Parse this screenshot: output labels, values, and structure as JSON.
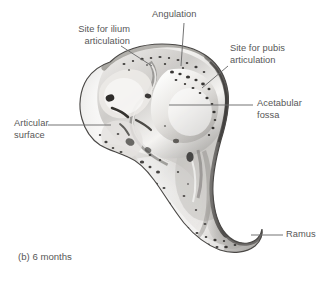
{
  "figure": {
    "caption": "(b) 6 months",
    "view": "lateral",
    "style": "grayscale anatomical illustration",
    "colors": {
      "background": "#ffffff",
      "label_text": "#575757",
      "leader_line": "#6d6d6d",
      "bone_outline": "#4a4a4a",
      "bone_light": "#f2f1ef",
      "bone_mid": "#b9b7b4",
      "bone_shadow": "#6f6d6b",
      "bone_dark": "#3d3b39"
    }
  },
  "labels": [
    {
      "id": "site-for-ilium-articulation",
      "text": "Site for ilium\narticulation",
      "align": "right",
      "x": 44,
      "y": 24,
      "width": 86,
      "leader": {
        "x1": 121,
        "y1": 46,
        "x2": 152,
        "y2": 66
      }
    },
    {
      "id": "angulation",
      "text": "Angulation",
      "align": "left",
      "x": 152,
      "y": 9,
      "width": 70,
      "leader": {
        "x1": 184,
        "y1": 23,
        "x2": 181,
        "y2": 66
      }
    },
    {
      "id": "site-for-pubis-articulation",
      "text": "Site for pubis\narticulation",
      "align": "left",
      "x": 230,
      "y": 43,
      "width": 90,
      "leader": {
        "x1": 228,
        "y1": 66,
        "x2": 202,
        "y2": 88
      }
    },
    {
      "id": "acetabular-fossa",
      "text": "Acetabular\nfossa",
      "align": "left",
      "x": 257,
      "y": 98,
      "width": 70,
      "leader": {
        "x1": 253,
        "y1": 105,
        "x2": 169,
        "y2": 105
      }
    },
    {
      "id": "articular-surface",
      "text": "Articular\nsurface",
      "align": "left",
      "x": 14,
      "y": 118,
      "width": 60,
      "leader": {
        "x1": 48,
        "y1": 125,
        "x2": 111,
        "y2": 125
      }
    },
    {
      "id": "ramus",
      "text": "Ramus",
      "align": "left",
      "x": 286,
      "y": 229,
      "width": 42,
      "leader": {
        "x1": 283,
        "y1": 235,
        "x2": 251,
        "y2": 235
      }
    }
  ]
}
